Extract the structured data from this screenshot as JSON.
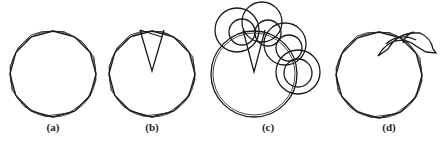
{
  "figure": {
    "panels": [
      {
        "id": "a",
        "label": "(a)",
        "description": "Dodecagon approximating a circle"
      },
      {
        "id": "b",
        "label": "(b)",
        "description": "Polygon with one triangular sector highlighted"
      },
      {
        "id": "c",
        "label": "(c)",
        "description": "Polygon with sector and overlapping circles along edge"
      },
      {
        "id": "d",
        "label": "(d)",
        "description": "Polygon with curved annular arc segment extending outward"
      }
    ],
    "colors": {
      "stroke": "#1a1a1a",
      "background": "#ffffff"
    }
  }
}
